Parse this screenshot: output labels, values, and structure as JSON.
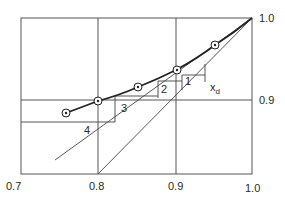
{
  "diagram": {
    "type": "McCabe-Thiele stepping diagram",
    "x_ticks": [
      "0.7",
      "0.8",
      "0.9",
      "1.0"
    ],
    "y_ticks": [
      "0.9",
      "1.0"
    ],
    "stage_labels": [
      "1",
      "2",
      "3",
      "4"
    ],
    "annotation": "x",
    "annotation_sub": "d",
    "colors": {
      "line": "#2a2a2a",
      "background": "#ffffff"
    }
  }
}
